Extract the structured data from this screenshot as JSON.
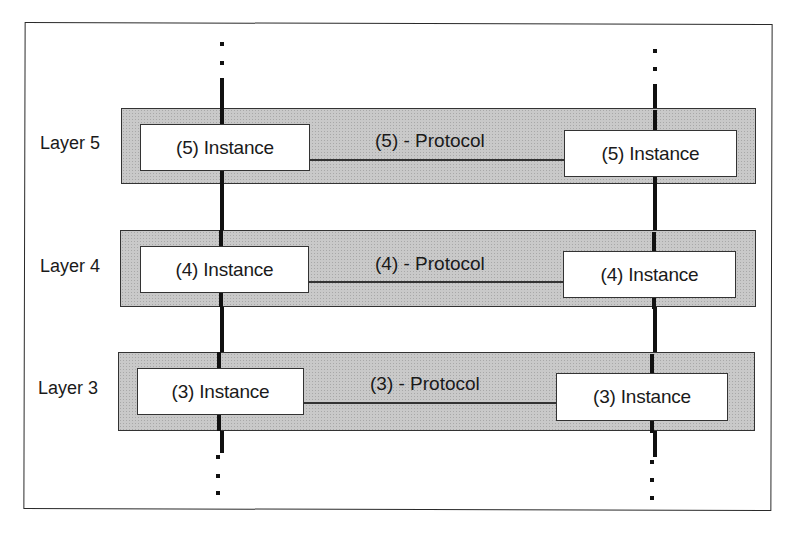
{
  "diagram": {
    "title": "",
    "left_stack": "A",
    "right_stack": "B",
    "continuation_marks": ":",
    "layers": [
      {
        "label": "Layer 5",
        "protocol": "(5) - Protocol",
        "left_instance": "(5) Instance",
        "right_instance": "(5) Instance"
      },
      {
        "label": "Layer 4",
        "protocol": "(4) - Protocol",
        "left_instance": "(4) Instance",
        "right_instance": "(4) Instance"
      },
      {
        "label": "Layer 3",
        "protocol": "(3) - Protocol",
        "left_instance": "(3) Instance",
        "right_instance": "(3) Instance"
      }
    ],
    "colors": {
      "band_fill": "#c9c9c9",
      "instance_fill": "#ffffff",
      "line": "#111111"
    }
  }
}
